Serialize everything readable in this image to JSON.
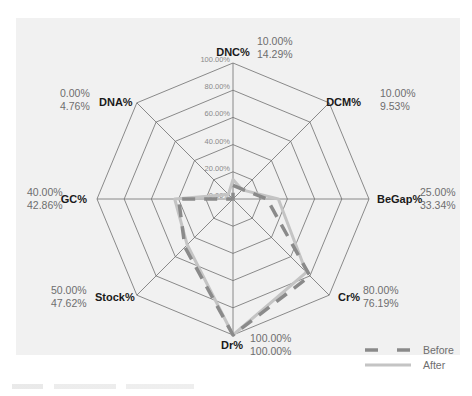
{
  "chart_data": {
    "type": "radar",
    "title": "",
    "axes": [
      "DNC%",
      "DCM%",
      "BeGap%",
      "Cr%",
      "Dr%",
      "Stock%",
      "GC%",
      "DNA%"
    ],
    "radial_ticks": [
      "0.00%",
      "20.00%",
      "40.00%",
      "60.00%",
      "80.00%",
      "100.00%"
    ],
    "rlim": [
      0,
      100
    ],
    "grid": true,
    "legend_position": "bottom-right",
    "series": [
      {
        "name": "Before",
        "style": "dashed",
        "color": "#8a8a8a",
        "values": [
          10.0,
          10.0,
          25.0,
          80.0,
          100.0,
          50.0,
          40.0,
          0.0
        ],
        "labels": [
          "10.00%",
          "10.00%",
          "25.00%",
          "80.00%",
          "100.00%",
          "50.00%",
          "40.00%",
          "0.00%"
        ]
      },
      {
        "name": "After",
        "style": "solid",
        "color": "#c4c4c4",
        "values": [
          14.29,
          9.53,
          33.34,
          76.19,
          100.0,
          47.62,
          42.86,
          4.76
        ],
        "labels": [
          "14.29%",
          "9.53%",
          "33.34%",
          "76.19%",
          "100.00%",
          "47.62%",
          "42.86%",
          "4.76%"
        ]
      }
    ]
  },
  "legend": {
    "before": "Before",
    "after": "After"
  }
}
